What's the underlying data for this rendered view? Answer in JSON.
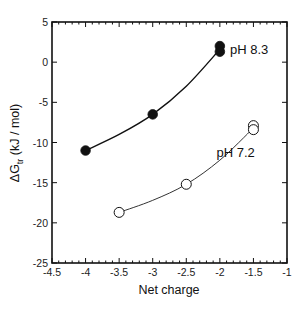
{
  "chart_data": {
    "type": "scatter",
    "title": "",
    "xlabel": "Net charge",
    "ylabel": "ΔG_tr (kJ / mol)",
    "ylabel_main": "ΔG",
    "ylabel_sub": "tr",
    "ylabel_unit": " (kJ / mol)",
    "xlim": [
      -4.5,
      -1
    ],
    "ylim": [
      -25,
      5
    ],
    "xticks": [
      -4.5,
      -4,
      -3.5,
      -3,
      -2.5,
      -2,
      -1.5,
      -1
    ],
    "xtick_labels": [
      "-4.5",
      "-4",
      "-3.5",
      "-3",
      "-2.5",
      "-2",
      "-1.5",
      "-1"
    ],
    "yticks": [
      -25,
      -20,
      -15,
      -10,
      -5,
      0,
      5
    ],
    "ytick_labels": [
      "-25",
      "-20",
      "-15",
      "-10",
      "-5",
      "0",
      "5"
    ],
    "grid": false,
    "legend": "inline labels",
    "series": [
      {
        "name": "pH 8.3",
        "marker": "filled-circle",
        "color": "#111111",
        "line_width": 1.4,
        "x": [
          -4,
          -3,
          -2,
          -2
        ],
        "y": [
          -11,
          -6.5,
          2.0,
          1.3
        ],
        "fit_curve": [
          [
            -4,
            -11
          ],
          [
            -3.5,
            -9.0
          ],
          [
            -3,
            -6.5
          ],
          [
            -2.5,
            -3.0
          ],
          [
            -2,
            1.6
          ]
        ],
        "label_pos": [
          -1.85,
          1.6
        ]
      },
      {
        "name": "pH 7.2",
        "marker": "open-circle",
        "color": "#333333",
        "line_width": 1.0,
        "x": [
          -3.5,
          -2.5,
          -1.5,
          -1.5
        ],
        "y": [
          -18.7,
          -15.2,
          -7.9,
          -8.4
        ],
        "fit_curve": [
          [
            -3.5,
            -18.7
          ],
          [
            -3,
            -17.2
          ],
          [
            -2.5,
            -15.2
          ],
          [
            -2,
            -12.2
          ],
          [
            -1.5,
            -8.2
          ]
        ],
        "label_pos": [
          -2.05,
          -11.2
        ]
      }
    ]
  }
}
